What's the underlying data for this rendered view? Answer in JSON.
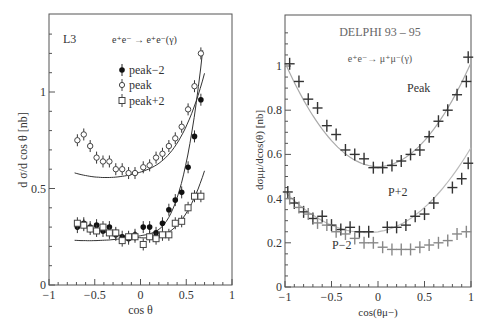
{
  "chart_data": [
    {
      "type": "scatter",
      "title": "L3",
      "process": "e⁺e⁻ → e⁺e⁻(γ)",
      "xlabel": "cos θ",
      "ylabel": "d σ/d cos θ [nb]",
      "xlim": [
        -1,
        1
      ],
      "ylim": [
        0,
        1.35
      ],
      "xticks": [
        "-1",
        "-0.5",
        "0",
        "0.5",
        "1"
      ],
      "yticks": [
        "0",
        "0.5",
        "1"
      ],
      "legend": [
        "peak−2",
        "peak",
        "peak+2"
      ],
      "grid": false,
      "series": [
        {
          "name": "peak-2",
          "marker": "filled-circle",
          "x": [
            -0.69,
            -0.62,
            -0.55,
            -0.48,
            -0.41,
            -0.34,
            -0.27,
            -0.2,
            -0.13,
            -0.06,
            0.03,
            0.1,
            0.17,
            0.24,
            0.31,
            0.38,
            0.45,
            0.52,
            0.59,
            0.66
          ],
          "y": [
            0.3,
            0.32,
            0.3,
            0.31,
            0.28,
            0.3,
            0.26,
            0.25,
            0.24,
            0.26,
            0.3,
            0.3,
            0.27,
            0.32,
            0.39,
            0.44,
            0.48,
            0.61,
            0.77,
            0.96
          ]
        },
        {
          "name": "peak",
          "marker": "open-diamond",
          "x": [
            -0.69,
            -0.62,
            -0.55,
            -0.48,
            -0.41,
            -0.34,
            -0.27,
            -0.2,
            -0.13,
            -0.06,
            0.03,
            0.1,
            0.17,
            0.24,
            0.31,
            0.38,
            0.45,
            0.52,
            0.59,
            0.66
          ],
          "y": [
            0.75,
            0.78,
            0.72,
            0.66,
            0.64,
            0.64,
            0.6,
            0.6,
            0.58,
            0.58,
            0.61,
            0.62,
            0.66,
            0.68,
            0.72,
            0.76,
            0.82,
            0.91,
            1.03,
            1.2
          ],
          "fit": "curve"
        },
        {
          "name": "peak+2",
          "marker": "open-square",
          "x": [
            -0.69,
            -0.62,
            -0.55,
            -0.48,
            -0.41,
            -0.34,
            -0.27,
            -0.2,
            -0.13,
            -0.06,
            0.03,
            0.1,
            0.17,
            0.24,
            0.31,
            0.38,
            0.45,
            0.52,
            0.59,
            0.66
          ],
          "y": [
            0.32,
            0.31,
            0.29,
            0.28,
            0.3,
            0.27,
            0.27,
            0.23,
            0.25,
            0.25,
            0.21,
            0.25,
            0.24,
            0.26,
            0.26,
            0.32,
            0.33,
            0.4,
            0.46,
            0.46
          ]
        }
      ]
    },
    {
      "type": "scatter",
      "title": "DELPHI 93 – 95",
      "process": "e⁺e⁻→ μ⁺μ⁻(γ)",
      "xlabel": "cos(θμ⁻)",
      "ylabel": "dσμμ/dcos(θ) [nb]",
      "xlim": [
        -1,
        1
      ],
      "ylim": [
        0,
        1.15
      ],
      "xticks": [
        "-1",
        "-0.5",
        "0",
        "0.5",
        "1"
      ],
      "yticks": [
        "0",
        "0.2",
        "0.4",
        "0.6",
        "0.8",
        "1"
      ],
      "grid": false,
      "series": [
        {
          "name": "Peak",
          "marker": "cross",
          "x": [
            -0.95,
            -0.85,
            -0.75,
            -0.65,
            -0.55,
            -0.45,
            -0.35,
            -0.25,
            -0.15,
            -0.05,
            0.05,
            0.15,
            0.25,
            0.35,
            0.45,
            0.55,
            0.65,
            0.75,
            0.85,
            0.95
          ],
          "y": [
            1.01,
            0.93,
            0.85,
            0.81,
            0.73,
            0.69,
            0.62,
            0.6,
            0.58,
            0.54,
            0.54,
            0.55,
            0.57,
            0.6,
            0.62,
            0.68,
            0.75,
            0.8,
            0.87,
            0.93
          ],
          "extra_end": {
            "x": 0.97,
            "y": 1.04
          }
        },
        {
          "name": "P+2",
          "marker": "cross",
          "x": [
            -0.97,
            -0.9,
            -0.8,
            -0.7,
            -0.6,
            -0.5,
            -0.4,
            -0.3,
            -0.2,
            -0.1,
            0.1,
            0.2,
            0.3,
            0.4,
            0.5,
            0.6,
            0.8,
            0.9,
            0.97
          ],
          "y": [
            0.43,
            0.38,
            0.34,
            0.31,
            0.32,
            0.28,
            0.26,
            0.27,
            0.25,
            0.25,
            0.27,
            0.27,
            0.28,
            0.32,
            0.33,
            0.38,
            0.45,
            0.49,
            0.56
          ]
        },
        {
          "name": "P-2",
          "marker": "cross",
          "x": [
            -0.95,
            -0.85,
            -0.75,
            -0.65,
            -0.55,
            -0.45,
            -0.35,
            -0.25,
            -0.15,
            -0.05,
            0.05,
            0.15,
            0.25,
            0.35,
            0.45,
            0.55,
            0.65,
            0.75,
            0.85,
            0.95
          ],
          "y": [
            0.4,
            0.36,
            0.33,
            0.29,
            0.28,
            0.25,
            0.24,
            0.22,
            0.2,
            0.2,
            0.18,
            0.17,
            0.17,
            0.17,
            0.18,
            0.19,
            0.2,
            0.21,
            0.24,
            0.25
          ]
        }
      ],
      "annotations": [
        "Peak",
        "P+2",
        "P−2"
      ]
    }
  ],
  "left": {
    "experiment": "L3",
    "process": "e⁺e⁻ → e⁺e⁻(γ)",
    "legend": {
      "peak_m2": "peak−2",
      "peak": "peak",
      "peak_p2": "peak+2"
    },
    "xlabel": "cos θ",
    "ylabel": "d σ/d cos θ [nb]",
    "xticks": [
      "−1",
      "−0.5",
      "0",
      "0.5",
      "1"
    ],
    "yticks": [
      "0",
      "0.5",
      "1"
    ]
  },
  "right": {
    "experiment": "DELPHI 93 – 95",
    "process": "e⁺e⁻→ μ⁺μ⁻(γ)",
    "labels": {
      "peak": "Peak",
      "p_plus_2": "P+2",
      "p_minus_2": "P−2"
    },
    "xlabel": "cos(θμ−)",
    "ylabel": "dσμμ/dcos(θ) [nb]",
    "xticks": [
      "−1",
      "−0.5",
      "0",
      "0.5",
      "1"
    ],
    "yticks": [
      "0",
      "0.2",
      "0.4",
      "0.6",
      "0.8",
      "1"
    ]
  }
}
